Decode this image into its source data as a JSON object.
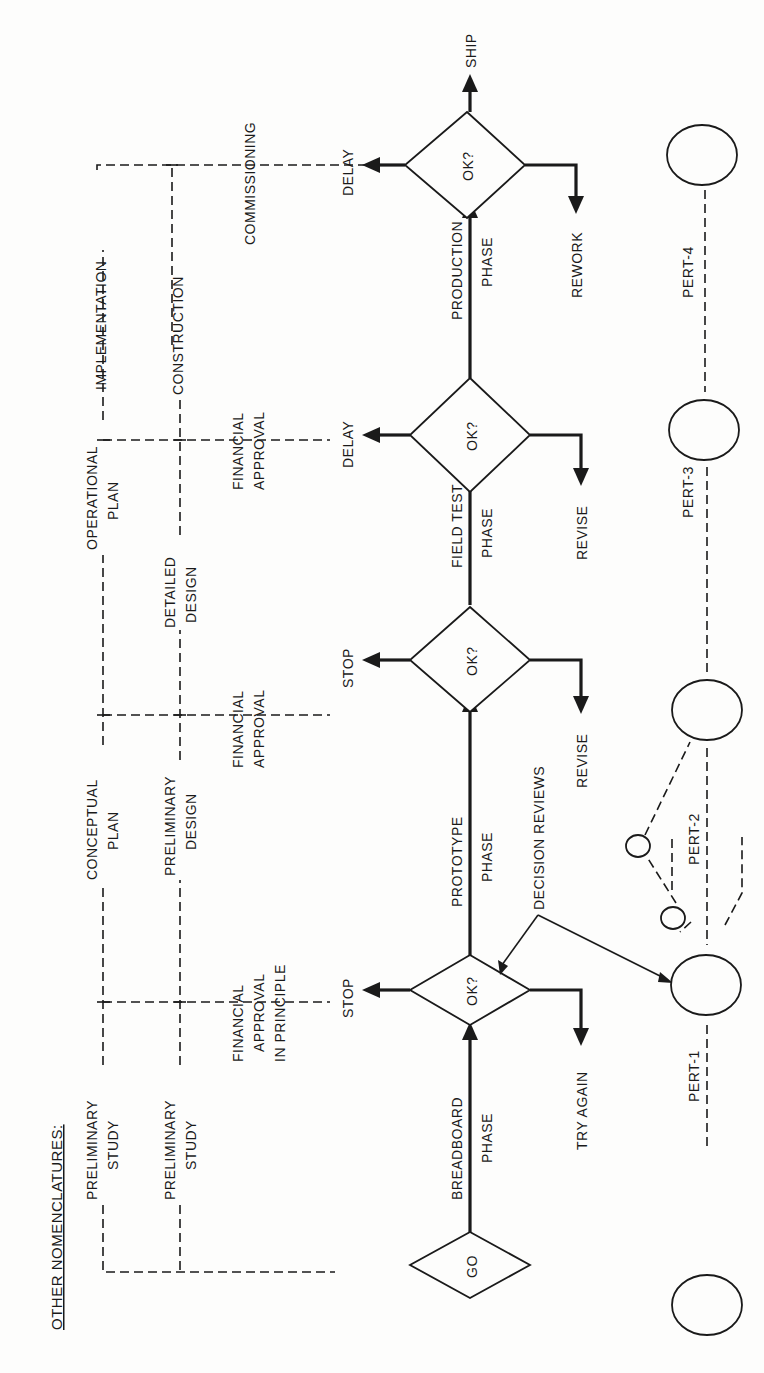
{
  "header": {
    "title": "OTHER NOMENCLATURES:"
  },
  "nomenclatures": {
    "row1": [
      "PRELIMINARY",
      "STUDY",
      "CONCEPTUAL",
      "PLAN",
      "OPERATIONAL",
      "PLAN",
      "IMPLEMENTATION"
    ],
    "row2": [
      "PRELIMINARY",
      "STUDY",
      "PRELIMINARY",
      "DESIGN",
      "DETAILED",
      "DESIGN",
      "CONSTRUCTION",
      "COMMISSIONING"
    ],
    "approvals": [
      "FINANCIAL",
      "APPROVAL",
      "IN PRINCIPLE",
      "FINANCIAL",
      "APPROVAL",
      "FINANCIAL",
      "APPROVAL"
    ]
  },
  "flow": {
    "start": "GO",
    "decision": "OK?",
    "phases": [
      {
        "line1": "BREADBOARD",
        "line2": "PHASE"
      },
      {
        "line1": "PROTOTYPE",
        "line2": "PHASE"
      },
      {
        "line1": "FIELD TEST",
        "line2": "PHASE"
      },
      {
        "line1": "PRODUCTION",
        "line2": "PHASE"
      }
    ],
    "reject_outcomes": [
      "STOP",
      "STOP",
      "DELAY",
      "DELAY"
    ],
    "loop_outcomes": [
      "TRY AGAIN",
      "REVISE",
      "REVISE",
      "REWORK"
    ],
    "final": "SHIP",
    "annotation": "DECISION REVIEWS"
  },
  "pert": {
    "labels": [
      "PERT-1",
      "PERT-2",
      "PERT-3",
      "PERT-4"
    ]
  }
}
